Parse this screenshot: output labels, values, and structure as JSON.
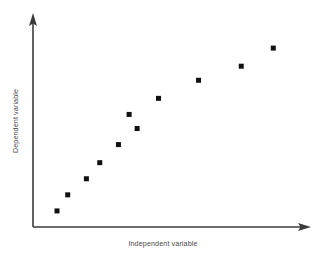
{
  "chart_data": {
    "type": "scatter",
    "title": "",
    "xlabel": "Independent variable",
    "ylabel": "Dependent variable",
    "grid": false,
    "legend": "none",
    "xlim": [
      0,
      100
    ],
    "ylim": [
      0,
      100
    ],
    "x_tick_labels": [],
    "y_tick_labels": [],
    "series": [
      {
        "name": "observations",
        "marker": "square",
        "color": "#111111",
        "points": [
          {
            "x": 9,
            "y": 8
          },
          {
            "x": 13,
            "y": 16
          },
          {
            "x": 20,
            "y": 24
          },
          {
            "x": 25,
            "y": 32
          },
          {
            "x": 32,
            "y": 41
          },
          {
            "x": 36,
            "y": 56
          },
          {
            "x": 39,
            "y": 49
          },
          {
            "x": 47,
            "y": 64
          },
          {
            "x": 62,
            "y": 73
          },
          {
            "x": 78,
            "y": 80
          },
          {
            "x": 90,
            "y": 89
          }
        ]
      }
    ]
  },
  "axes": {
    "x_axis_name": "x-axis",
    "y_axis_name": "y-axis",
    "axis_color": "#3b3b3b",
    "marker_color": "#111111",
    "background_color": "#ffffff"
  },
  "geometry": {
    "origin_x": 33,
    "origin_y": 227,
    "x_axis_end": 310,
    "y_axis_end": 14,
    "plot_right": 300,
    "plot_top": 26,
    "marker_size": 5
  },
  "labels": {
    "x_label_x": 160,
    "x_label_y": 244,
    "y_label_x": 18,
    "y_label_y": 120
  }
}
